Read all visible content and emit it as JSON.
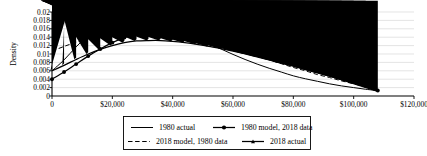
{
  "chart_data": {
    "type": "line",
    "title": "",
    "xlabel": "",
    "ylabel": "Density",
    "xlim": [
      0,
      120000
    ],
    "ylim": [
      0,
      0.02
    ],
    "grid": true,
    "legend_position": "bottom",
    "x_ticks": [
      "0",
      "$20,000",
      "$40,000",
      "$60,000",
      "$80,000",
      "$100,000",
      "$120,000"
    ],
    "x_tick_values": [
      0,
      20000,
      40000,
      60000,
      80000,
      100000,
      120000
    ],
    "y_ticks": [
      "0",
      "0.002",
      "0.004",
      "0.006",
      "0.008",
      "0.01",
      "0.012",
      "0.014",
      "0.016",
      "0.018",
      "0.02"
    ],
    "y_tick_values": [
      0,
      0.002,
      0.004,
      0.006,
      0.008,
      0.01,
      0.012,
      0.014,
      0.016,
      0.018,
      0.02
    ],
    "x": [
      0,
      4000,
      8000,
      12000,
      16000,
      20000,
      24000,
      28000,
      32000,
      36000,
      40000,
      44000,
      48000,
      52000,
      56000,
      60000,
      64000,
      68000,
      72000,
      76000,
      80000,
      84000,
      88000,
      92000,
      96000,
      100000,
      104000,
      108000
    ],
    "series": [
      {
        "name": "1980 actual",
        "style": "solid",
        "marker": "none",
        "color": "#000000",
        "values": [
          0.006,
          0.0086,
          0.0117,
          0.0145,
          0.0168,
          0.0182,
          0.0188,
          0.0188,
          0.0184,
          0.0176,
          0.0165,
          0.0152,
          0.0139,
          0.0125,
          0.0112,
          0.0099,
          0.0087,
          0.0076,
          0.0066,
          0.0057,
          0.0048,
          0.0041,
          0.0035,
          0.0029,
          0.0024,
          0.002,
          0.0016,
          0.0013
        ]
      },
      {
        "name": "1980 model, 2018 data",
        "style": "solid",
        "marker": "circle",
        "color": "#000000",
        "values": [
          0.004,
          0.0057,
          0.0076,
          0.0095,
          0.0112,
          0.0127,
          0.0139,
          0.0148,
          0.0154,
          0.0157,
          0.0158,
          0.0157,
          0.0154,
          0.0149,
          0.0143,
          0.0136,
          0.0128,
          0.0119,
          0.011,
          0.01,
          0.009,
          0.0079,
          0.0068,
          0.0057,
          0.0046,
          0.0035,
          0.0024,
          0.0013
        ]
      },
      {
        "name": "2018 model, 1980 data",
        "style": "dashed",
        "marker": "none",
        "color": "#000000",
        "values": [
          0.0107,
          0.0118,
          0.0128,
          0.0136,
          0.0143,
          0.0148,
          0.0151,
          0.0152,
          0.0152,
          0.015,
          0.0147,
          0.0142,
          0.0136,
          0.0129,
          0.0121,
          0.0113,
          0.0104,
          0.0095,
          0.0086,
          0.0077,
          0.0068,
          0.006,
          0.0051,
          0.0044,
          0.0036,
          0.0029,
          0.0022,
          0.0014
        ]
      },
      {
        "name": "2018 actual",
        "style": "solid",
        "marker": "triangle",
        "color": "#000000",
        "values": [
          0.006,
          0.0073,
          0.0087,
          0.01,
          0.0111,
          0.012,
          0.0127,
          0.0131,
          0.0132,
          0.0132,
          0.013,
          0.0127,
          0.0123,
          0.0118,
          0.0113,
          0.0107,
          0.01,
          0.0093,
          0.0086,
          0.0078,
          0.0071,
          0.0063,
          0.0055,
          0.0047,
          0.0039,
          0.0031,
          0.0022,
          0.0011
        ]
      }
    ]
  },
  "legend": {
    "items": [
      {
        "label": "1980 actual"
      },
      {
        "label": "1980 model, 2018 data"
      },
      {
        "label": "2018 model, 1980 data"
      },
      {
        "label": "2018 actual"
      }
    ]
  },
  "axes": {
    "y_title": "Density"
  }
}
